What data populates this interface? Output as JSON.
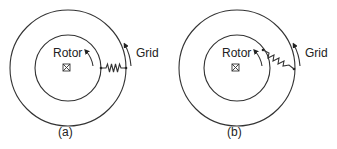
{
  "diagrams": [
    {
      "id": "a",
      "caption": "(a)",
      "rotor_label": "Rotor",
      "grid_label": "Grid",
      "center_symbol": "crossed-square-icon",
      "spring_state": "unstretched, horizontal (rotor aligned with grid)"
    },
    {
      "id": "b",
      "caption": "(b)",
      "rotor_label": "Rotor",
      "grid_label": "Grid",
      "center_symbol": "crossed-square-icon",
      "spring_state": "stretched, angled (rotor leads/lags grid)"
    }
  ],
  "colors": {
    "stroke": "#333333",
    "text": "#222222",
    "background": "#ffffff"
  }
}
